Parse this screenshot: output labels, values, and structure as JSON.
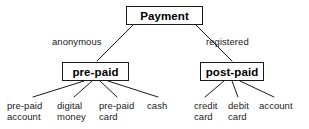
{
  "diagram": {
    "type": "tree-taxonomy",
    "title": "Payment",
    "line_color": "#1a1a1a",
    "box_border_color": "#1a1a1a",
    "background_color": "#ffffff",
    "text_color": "#000000",
    "root": {
      "label": "Payment"
    },
    "branches": [
      {
        "edge_label": "anonymous",
        "node_label": "pre-paid",
        "leaves": [
          {
            "line1": "pre-paid",
            "line2": "account"
          },
          {
            "line1": "digital",
            "line2": "money"
          },
          {
            "line1": "pre-paid",
            "line2": "card"
          },
          {
            "line1": "cash",
            "line2": ""
          }
        ]
      },
      {
        "edge_label": "registered",
        "node_label": "post-paid",
        "leaves": [
          {
            "line1": "credit",
            "line2": "card"
          },
          {
            "line1": "debit",
            "line2": "card"
          },
          {
            "line1": "account",
            "line2": ""
          }
        ]
      }
    ]
  }
}
